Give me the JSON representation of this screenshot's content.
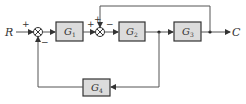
{
  "diagram": {
    "type": "block-diagram",
    "input_label": "R",
    "output_label": "C",
    "blocks": [
      {
        "id": "G1",
        "label": "G",
        "sub": "1"
      },
      {
        "id": "G2",
        "label": "G",
        "sub": "2"
      },
      {
        "id": "G3",
        "label": "G",
        "sub": "3"
      },
      {
        "id": "G4",
        "label": "G",
        "sub": "4"
      }
    ],
    "summing_junctions": [
      {
        "id": "S1",
        "signs": {
          "left": "+",
          "bottom": "−"
        }
      },
      {
        "id": "S2",
        "signs": {
          "left": "+",
          "top": "+",
          "right": "−"
        }
      }
    ],
    "colors": {
      "block_fill": "#dcdcdc",
      "stroke": "#333333",
      "line": "#555555"
    }
  }
}
